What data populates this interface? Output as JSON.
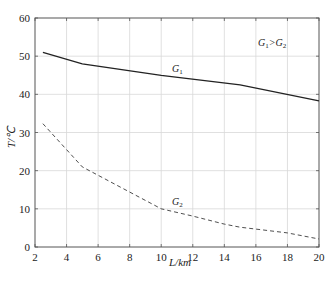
{
  "chart_data": {
    "type": "line",
    "title": "",
    "xlabel": "L/km",
    "ylabel": "T/℃",
    "xlim": [
      2,
      20
    ],
    "ylim": [
      0,
      60
    ],
    "xticks": [
      2,
      4,
      6,
      8,
      10,
      12,
      14,
      16,
      18,
      20
    ],
    "yticks": [
      0,
      10,
      20,
      30,
      40,
      50,
      60
    ],
    "grid": true,
    "legend_position": "none (inline labels)",
    "annotation": "G1>G2",
    "series": [
      {
        "name": "G1",
        "style": "solid",
        "x": [
          2.5,
          5,
          10,
          15,
          20
        ],
        "values": [
          51,
          48,
          45,
          42.5,
          38.3
        ]
      },
      {
        "name": "G2",
        "style": "dashed",
        "x": [
          2.5,
          5,
          10,
          12,
          14,
          15,
          16,
          18,
          20
        ],
        "values": [
          32.3,
          21,
          10,
          8.1,
          6,
          5.2,
          4.7,
          3.7,
          2.1
        ]
      }
    ]
  },
  "labels": {
    "x_axis": "L/km",
    "y_axis": "T/℃",
    "annotation_main": "G",
    "annotation_sub1": "1",
    "annotation_gt": ">G",
    "annotation_sub2": "2",
    "g1_main": "G",
    "g1_sub": "1",
    "g2_main": "G",
    "g2_sub": "2"
  },
  "colors": {
    "line": "#222222",
    "grid": "#d8d8d8",
    "axis": "#555555"
  }
}
